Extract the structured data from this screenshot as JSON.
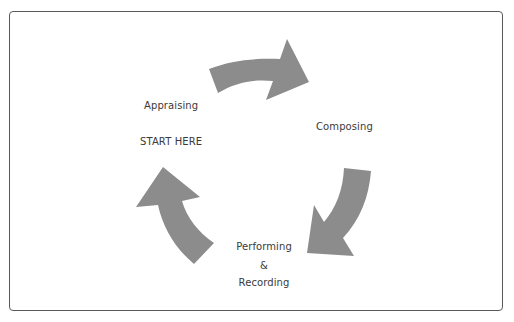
{
  "diagram": {
    "type": "cycle",
    "direction": "clockwise",
    "arrow_color": "#8c8c8c",
    "frame_color": "#5a5a5a",
    "stages": [
      {
        "id": "appraising",
        "label": "Appraising",
        "note": "START HERE"
      },
      {
        "id": "composing",
        "label": "Composing"
      },
      {
        "id": "performing",
        "label_lines": [
          "Performing",
          "&",
          "Recording"
        ]
      }
    ],
    "arrows": [
      {
        "from": "appraising",
        "to": "composing",
        "position": "top"
      },
      {
        "from": "composing",
        "to": "performing",
        "position": "right"
      },
      {
        "from": "performing",
        "to": "appraising",
        "position": "left"
      }
    ]
  }
}
